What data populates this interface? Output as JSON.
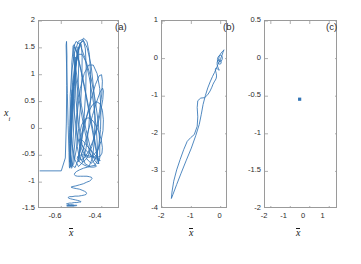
{
  "figure": {
    "background_color": "#ffffff",
    "line_color": "#3274b5",
    "axis_color": "#9a9a9a",
    "text_color": "#2b2b2b"
  },
  "panels": [
    {
      "tag": "(a)",
      "xlabel": "x",
      "ylabel": "x",
      "ylabel_sub": "i",
      "xticks": [
        "-0.6",
        "-0.4"
      ],
      "yticks": [
        "2",
        "1.5",
        "1",
        "0.5",
        "0",
        "-0.5",
        "-1",
        "-1.5"
      ]
    },
    {
      "tag": "(b)",
      "xlabel": "x",
      "xticks": [
        "-2",
        "-1",
        "0"
      ],
      "yticks": [
        "1",
        "0",
        "-1",
        "-2",
        "-3",
        "-4"
      ]
    },
    {
      "tag": "(c)",
      "xlabel": "x",
      "xticks": [
        "-2",
        "-1",
        "0",
        "1"
      ],
      "yticks": [
        "0.5",
        "0",
        "-0.5",
        "-1",
        "-1.5",
        "-2"
      ]
    }
  ],
  "chart_data": [
    {
      "type": "line",
      "title": "(a)",
      "xlabel": "x-bar",
      "ylabel": "x_i",
      "xlim": [
        -0.71,
        -0.31
      ],
      "ylim": [
        -1.5,
        2.0
      ],
      "xticks": [
        -0.6,
        -0.4
      ],
      "yticks": [
        -1.5,
        -1.0,
        -0.5,
        0.0,
        0.5,
        1.0,
        1.5,
        2.0
      ],
      "grid": false,
      "legend": "none",
      "description": "Chaotic trajectory: tall near-vertical oscillatory loops spanning x_i from about -1.45 to 1.7 over x-bar from -0.62 to -0.36, with dense low-amplitude wandering below x_i = -0.8.",
      "x": [
        -0.705,
        -0.6,
        -0.58,
        -0.575,
        -0.573,
        -0.572,
        -0.574,
        -0.576,
        -0.574,
        -0.57,
        -0.566,
        -0.562,
        -0.56,
        -0.558,
        -0.556,
        -0.554,
        -0.552,
        -0.55,
        -0.548,
        -0.546,
        -0.545,
        -0.546,
        -0.549,
        -0.553,
        -0.556,
        -0.558,
        -0.557,
        -0.554,
        -0.55,
        -0.545,
        -0.54,
        -0.536,
        -0.533,
        -0.531,
        -0.53,
        -0.531,
        -0.534,
        -0.538,
        -0.543,
        -0.548,
        -0.552,
        -0.554,
        -0.553,
        -0.549,
        -0.543,
        -0.536,
        -0.529,
        -0.522,
        -0.517,
        -0.514,
        -0.514,
        -0.517,
        -0.523,
        -0.531,
        -0.54,
        -0.548,
        -0.554,
        -0.556,
        -0.554,
        -0.548,
        -0.539,
        -0.528,
        -0.517,
        -0.507,
        -0.5,
        -0.497,
        -0.498,
        -0.504,
        -0.514,
        -0.526,
        -0.539,
        -0.55,
        -0.557,
        -0.559,
        -0.555,
        -0.546,
        -0.533,
        -0.518,
        -0.503,
        -0.49,
        -0.481,
        -0.477,
        -0.479,
        -0.487,
        -0.5,
        -0.516,
        -0.532,
        -0.546,
        -0.556,
        -0.559,
        -0.555,
        -0.544,
        -0.528,
        -0.509,
        -0.49,
        -0.473,
        -0.461,
        -0.455,
        -0.456,
        -0.464,
        -0.478,
        -0.496,
        -0.515,
        -0.533,
        -0.547,
        -0.555,
        -0.556,
        -0.549,
        -0.535,
        -0.516,
        -0.494,
        -0.472,
        -0.453,
        -0.44,
        -0.434,
        -0.436,
        -0.446,
        -0.462,
        -0.482,
        -0.503,
        -0.523,
        -0.538,
        -0.547,
        -0.548,
        -0.541,
        -0.527,
        -0.507,
        -0.484,
        -0.461,
        -0.441,
        -0.427,
        -0.421,
        -0.423,
        -0.433,
        -0.45,
        -0.471,
        -0.493,
        -0.514,
        -0.53,
        -0.54,
        -0.542,
        -0.536,
        -0.522,
        -0.503,
        -0.48,
        -0.457,
        -0.437,
        -0.422,
        -0.415,
        -0.416,
        -0.425,
        -0.441,
        -0.462,
        -0.485,
        -0.506,
        -0.523,
        -0.534,
        -0.537,
        -0.532,
        -0.519,
        -0.5,
        -0.478,
        -0.455,
        -0.434,
        -0.419,
        -0.41,
        -0.41,
        -0.417,
        -0.432,
        -0.452,
        -0.475,
        -0.497,
        -0.515,
        -0.527,
        -0.531,
        -0.527,
        -0.515,
        -0.497,
        -0.476,
        -0.453,
        -0.432,
        -0.416,
        -0.406,
        -0.404,
        -0.41,
        -0.423,
        -0.442,
        -0.465,
        -0.487,
        -0.506,
        -0.519,
        -0.524,
        -0.521,
        -0.51,
        -0.493,
        -0.472,
        -0.449,
        -0.428,
        -0.411,
        -0.4,
        -0.397,
        -0.401,
        -0.413,
        -0.431,
        -0.453,
        -0.476,
        -0.496,
        -0.51,
        -0.516,
        -0.514,
        -0.504,
        -0.488,
        -0.468,
        -0.446,
        -0.425,
        -0.408,
        -0.396,
        -0.392,
        -0.395,
        -0.406,
        -0.423,
        -0.444,
        -0.467,
        -0.488,
        -0.503,
        -0.511,
        -0.51,
        -0.501,
        -0.486,
        -0.467,
        -0.446,
        -0.426,
        -0.409,
        -0.397,
        -0.392,
        -0.394,
        -0.404,
        -0.42,
        -0.441,
        -0.463,
        -0.484,
        -0.5,
        -0.508,
        -0.508,
        -0.5,
        -0.486,
        -0.468,
        -0.448,
        -0.429,
        -0.413,
        -0.402,
        -0.397,
        -0.399,
        -0.408,
        -0.423,
        -0.443,
        -0.465,
        -0.485,
        -0.501,
        -0.51,
        -0.511,
        -0.504,
        -0.491,
        -0.474,
        -0.455,
        -0.437,
        -0.422,
        -0.412,
        -0.408,
        -0.41,
        -0.419,
        -0.434,
        -0.453,
        -0.474,
        -0.494,
        -0.51,
        -0.519,
        -0.521,
        -0.516,
        -0.504,
        -0.488,
        -0.47,
        -0.453,
        -0.439,
        -0.429,
        -0.426,
        -0.429,
        -0.438,
        -0.452,
        -0.47,
        -0.49,
        -0.509,
        -0.524,
        -0.533,
        -0.535,
        -0.531,
        -0.52,
        -0.505,
        -0.489,
        -0.473,
        -0.46,
        -0.451,
        -0.448,
        -0.451,
        -0.46,
        -0.474,
        -0.491,
        -0.51,
        -0.528,
        -0.542,
        -0.55,
        -0.552,
        -0.548,
        -0.539,
        -0.526,
        -0.511,
        -0.497,
        -0.485,
        -0.477,
        -0.475,
        -0.478,
        -0.486,
        -0.499,
        -0.515,
        -0.532,
        -0.547,
        -0.559,
        -0.565,
        -0.566,
        -0.562,
        -0.554,
        -0.543,
        -0.531,
        -0.519,
        -0.51,
        -0.504,
        -0.502,
        -0.505,
        -0.512,
        -0.523,
        -0.536,
        -0.549,
        -0.561,
        -0.569,
        -0.573,
        -0.573,
        -0.569,
        -0.562,
        -0.553,
        -0.544,
        -0.535,
        -0.528,
        -0.524,
        -0.523,
        -0.525,
        -0.531,
        -0.539,
        -0.549,
        -0.558,
        -0.566,
        -0.571,
        -0.573,
        -0.572,
        -0.568,
        -0.562,
        -0.555,
        -0.548,
        -0.542,
        -0.538,
        -0.536,
        -0.537,
        -0.54,
        -0.546,
        -0.552,
        -0.559,
        -0.565,
        -0.569,
        -0.571,
        -0.57,
        -0.567,
        -0.563,
        -0.558,
        -0.553,
        -0.549,
        -0.546,
        -0.545,
        -0.545,
        -0.548,
        -0.552,
        -0.556,
        -0.56,
        -0.564,
        -0.566,
        -0.567,
        -0.566,
        -0.563,
        -0.56,
        -0.556,
        -0.553,
        -0.55,
        -0.549,
        -0.549,
        -0.55,
        -0.552
      ],
      "y": [
        -0.79,
        -0.79,
        -0.55,
        0.1,
        0.8,
        1.35,
        1.62,
        1.55,
        1.2,
        0.65,
        0.05,
        -0.45,
        -0.72,
        -0.74,
        -0.58,
        -0.3,
        0.05,
        0.4,
        0.65,
        0.72,
        0.6,
        0.3,
        -0.05,
        -0.38,
        -0.58,
        -0.63,
        -0.52,
        -0.28,
        0.05,
        0.42,
        0.78,
        1.08,
        1.28,
        1.33,
        1.22,
        0.95,
        0.55,
        0.1,
        -0.3,
        -0.58,
        -0.7,
        -0.64,
        -0.42,
        -0.08,
        0.35,
        0.78,
        1.15,
        1.42,
        1.52,
        1.44,
        1.18,
        0.78,
        0.3,
        -0.18,
        -0.55,
        -0.74,
        -0.72,
        -0.5,
        -0.14,
        0.3,
        0.75,
        1.15,
        1.45,
        1.6,
        1.55,
        1.32,
        0.95,
        0.48,
        0.0,
        -0.4,
        -0.66,
        -0.72,
        -0.58,
        -0.28,
        0.15,
        0.62,
        1.05,
        1.4,
        1.6,
        1.63,
        1.48,
        1.16,
        0.72,
        0.22,
        -0.25,
        -0.58,
        -0.73,
        -0.68,
        -0.45,
        -0.08,
        0.38,
        0.85,
        1.25,
        1.55,
        1.68,
        1.62,
        1.38,
        1.0,
        0.52,
        0.02,
        -0.38,
        -0.64,
        -0.71,
        -0.58,
        -0.28,
        0.14,
        0.6,
        1.05,
        1.4,
        1.62,
        1.66,
        1.5,
        1.18,
        0.74,
        0.24,
        -0.22,
        -0.55,
        -0.7,
        -0.66,
        -0.44,
        -0.08,
        0.36,
        0.82,
        1.22,
        1.5,
        1.62,
        1.56,
        1.32,
        0.94,
        0.48,
        0.0,
        -0.38,
        -0.62,
        -0.68,
        -0.56,
        -0.28,
        0.12,
        0.58,
        1.0,
        1.34,
        1.54,
        1.56,
        1.4,
        1.08,
        0.65,
        0.18,
        -0.24,
        -0.54,
        -0.66,
        -0.62,
        -0.42,
        -0.08,
        0.34,
        0.78,
        1.15,
        1.42,
        1.52,
        1.45,
        1.22,
        0.86,
        0.42,
        -0.02,
        -0.38,
        -0.6,
        -0.66,
        -0.55,
        -0.28,
        0.1,
        0.52,
        0.92,
        1.22,
        1.38,
        1.38,
        1.22,
        0.92,
        0.52,
        0.08,
        -0.3,
        -0.56,
        -0.65,
        -0.58,
        -0.36,
        -0.02,
        0.36,
        0.74,
        1.02,
        1.18,
        1.18,
        1.02,
        0.74,
        0.36,
        -0.02,
        -0.34,
        -0.56,
        -0.63,
        -0.55,
        -0.34,
        -0.02,
        0.32,
        0.64,
        0.88,
        1.0,
        0.98,
        0.82,
        0.55,
        0.2,
        -0.14,
        -0.42,
        -0.58,
        -0.62,
        -0.54,
        -0.34,
        -0.06,
        0.24,
        0.5,
        0.68,
        0.75,
        0.7,
        0.54,
        0.3,
        0.02,
        -0.24,
        -0.44,
        -0.56,
        -0.58,
        -0.5,
        -0.34,
        -0.12,
        0.1,
        0.3,
        0.44,
        0.5,
        0.46,
        0.34,
        0.16,
        -0.04,
        -0.24,
        -0.4,
        -0.5,
        -0.54,
        -0.5,
        -0.38,
        -0.24,
        -0.08,
        0.06,
        0.16,
        0.2,
        0.16,
        0.06,
        -0.08,
        -0.22,
        -0.36,
        -0.46,
        -0.52,
        -0.54,
        -0.52,
        -0.46,
        -0.38,
        -0.3,
        -0.24,
        -0.2,
        -0.2,
        -0.24,
        -0.32,
        -0.4,
        -0.48,
        -0.54,
        -0.58,
        -0.6,
        -0.6,
        -0.58,
        -0.55,
        -0.52,
        -0.5,
        -0.49,
        -0.5,
        -0.52,
        -0.56,
        -0.6,
        -0.64,
        -0.68,
        -0.71,
        -0.72,
        -0.72,
        -0.71,
        -0.7,
        -0.69,
        -0.69,
        -0.7,
        -0.72,
        -0.74,
        -0.77,
        -0.8,
        -0.83,
        -0.86,
        -0.88,
        -0.89,
        -0.89,
        -0.89,
        -0.89,
        -0.9,
        -0.91,
        -0.93,
        -0.95,
        -0.98,
        -1.0,
        -1.03,
        -1.05,
        -1.07,
        -1.08,
        -1.09,
        -1.09,
        -1.1,
        -1.11,
        -1.12,
        -1.13,
        -1.15,
        -1.17,
        -1.19,
        -1.21,
        -1.23,
        -1.24,
        -1.25,
        -1.26,
        -1.26,
        -1.27,
        -1.27,
        -1.28,
        -1.29,
        -1.3,
        -1.31,
        -1.32,
        -1.33,
        -1.34,
        -1.35,
        -1.36,
        -1.36,
        -1.37,
        -1.37,
        -1.38,
        -1.38,
        -1.39,
        -1.39,
        -1.4,
        -1.4,
        -1.41,
        -1.41,
        -1.42,
        -1.42,
        -1.42,
        -1.43,
        -1.43,
        -1.43,
        -1.43,
        -1.44,
        -1.44,
        -1.44,
        -1.44,
        -1.44,
        -1.44,
        -1.44,
        -1.44,
        -1.44,
        -1.44,
        -1.44,
        -1.44,
        -1.44,
        -1.44,
        -1.44,
        -1.44,
        -1.44,
        -1.44,
        -1.44,
        -1.44,
        -1.44,
        -1.44,
        -1.44,
        -1.44
      ]
    },
    {
      "type": "line",
      "title": "(b)",
      "xlabel": "x-bar",
      "ylabel": "",
      "xlim": [
        -2.0,
        0.25
      ],
      "ylim": [
        -4.0,
        1.0
      ],
      "xticks": [
        -2,
        -1,
        0
      ],
      "yticks": [
        -4,
        -3,
        -2,
        -1,
        0,
        1
      ],
      "grid": false,
      "legend": "none",
      "description": "A single large elongated loop from a cusp near (-1.68, -3.72) rising steeply to small spiral coils near (0.0, 0.1); the two branches of the loop are slightly separated with a kink near (-0.75, -1.05).",
      "x": [
        0.1,
        0.05,
        -0.01,
        -0.05,
        -0.07,
        -0.06,
        -0.02,
        0.02,
        0.05,
        0.06,
        0.04,
        0.0,
        -0.05,
        -0.09,
        -0.11,
        -0.1,
        -0.07,
        -0.03,
        0.0,
        0.02,
        0.01,
        -0.02,
        -0.06,
        -0.1,
        -0.12,
        -0.12,
        -0.1,
        -0.07,
        -0.05,
        -0.05,
        -0.07,
        -0.1,
        -0.14,
        -0.17,
        -0.18,
        -0.17,
        -0.15,
        -0.14,
        -0.15,
        -0.18,
        -0.22,
        -0.26,
        -0.3,
        -0.36,
        -0.44,
        -0.55,
        -0.68,
        -0.78,
        -0.8,
        -0.78,
        -0.8,
        -0.9,
        -1.02,
        -1.14,
        -1.26,
        -1.38,
        -1.5,
        -1.6,
        -1.66,
        -1.68,
        -1.63,
        -1.5,
        -1.35,
        -1.18,
        -1.0,
        -0.85,
        -0.73,
        -0.66,
        -0.6,
        -0.52,
        -0.44,
        -0.36,
        -0.28,
        -0.21,
        -0.16,
        -0.12,
        -0.09,
        -0.06,
        -0.03,
        0.0,
        0.03,
        0.06,
        0.08,
        0.1,
        0.11
      ],
      "y": [
        0.22,
        0.18,
        0.12,
        0.05,
        -0.02,
        -0.07,
        -0.09,
        -0.07,
        -0.02,
        0.03,
        0.07,
        0.09,
        0.08,
        0.04,
        -0.02,
        -0.08,
        -0.13,
        -0.15,
        -0.14,
        -0.11,
        -0.07,
        -0.04,
        -0.03,
        -0.05,
        -0.1,
        -0.16,
        -0.22,
        -0.27,
        -0.3,
        -0.31,
        -0.3,
        -0.28,
        -0.26,
        -0.26,
        -0.29,
        -0.34,
        -0.4,
        -0.46,
        -0.52,
        -0.57,
        -0.62,
        -0.68,
        -0.76,
        -0.86,
        -0.96,
        -1.04,
        -1.05,
        -1.12,
        -1.3,
        -1.55,
        -1.8,
        -2.02,
        -2.1,
        -2.2,
        -2.42,
        -2.68,
        -2.96,
        -3.26,
        -3.55,
        -3.72,
        -3.62,
        -3.35,
        -3.05,
        -2.72,
        -2.38,
        -2.05,
        -1.75,
        -1.48,
        -1.22,
        -0.98,
        -0.78,
        -0.62,
        -0.48,
        -0.37,
        -0.28,
        -0.21,
        -0.15,
        -0.1,
        -0.05,
        0.0,
        0.06,
        0.12,
        0.17,
        0.21,
        0.23
      ]
    },
    {
      "type": "scatter",
      "title": "(c)",
      "xlabel": "x-bar",
      "ylabel": "",
      "xlim": [
        -2.3,
        1.45
      ],
      "ylim": [
        -2.0,
        0.5
      ],
      "xticks": [
        -2,
        -1,
        0,
        1
      ],
      "yticks": [
        -2,
        -1.5,
        -1,
        -0.5,
        0,
        0.5
      ],
      "grid": false,
      "legend": "none",
      "marker": "square",
      "description": "A single fixed point plotted as one small filled square marker.",
      "points": [
        {
          "x": -0.52,
          "y": -0.54
        }
      ]
    }
  ]
}
